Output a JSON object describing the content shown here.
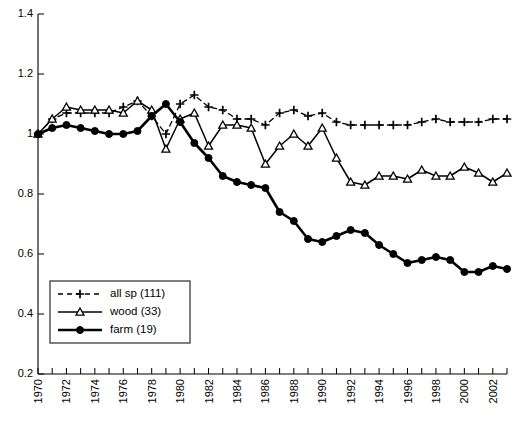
{
  "chart_data": {
    "type": "line",
    "title": "",
    "xlabel": "",
    "ylabel": "",
    "xlim": [
      1970,
      2003
    ],
    "ylim": [
      0.2,
      1.4
    ],
    "yticks": [
      "0.2",
      "0.4",
      "0.6",
      "0.8",
      "1",
      "1.2",
      "1.4"
    ],
    "ytick_values": [
      0.2,
      0.4,
      0.6,
      0.8,
      1.0,
      1.2,
      1.4
    ],
    "xticks": [
      "1970",
      "1972",
      "1974",
      "1976",
      "1978",
      "1980",
      "1982",
      "1984",
      "1986",
      "1988",
      "1990",
      "1992",
      "1994",
      "1996",
      "1998",
      "2000",
      "2002"
    ],
    "xtick_values": [
      1970,
      1972,
      1974,
      1976,
      1978,
      1980,
      1982,
      1984,
      1986,
      1988,
      1990,
      1992,
      1994,
      1996,
      1998,
      2000,
      2002
    ],
    "grid": false,
    "legend_position": "lower-left",
    "x": [
      1970,
      1971,
      1972,
      1973,
      1974,
      1975,
      1976,
      1977,
      1978,
      1979,
      1980,
      1981,
      1982,
      1983,
      1984,
      1985,
      1986,
      1987,
      1988,
      1989,
      1990,
      1991,
      1992,
      1993,
      1994,
      1995,
      1996,
      1997,
      1998,
      1999,
      2000,
      2001,
      2002,
      2003
    ],
    "series": [
      {
        "name": "all sp (111)",
        "label": "all sp (111)",
        "marker": "plus",
        "linestyle": "dashed",
        "linewidth": 1.3,
        "color": "#000000",
        "values": [
          1.0,
          1.05,
          1.07,
          1.07,
          1.07,
          1.07,
          1.09,
          1.11,
          1.06,
          1.0,
          1.1,
          1.13,
          1.09,
          1.08,
          1.05,
          1.05,
          1.03,
          1.07,
          1.08,
          1.06,
          1.07,
          1.04,
          1.03,
          1.03,
          1.03,
          1.03,
          1.03,
          1.04,
          1.05,
          1.04,
          1.04,
          1.04,
          1.05,
          1.05
        ]
      },
      {
        "name": "wood (33)",
        "label": "wood (33)",
        "marker": "triangle",
        "linestyle": "solid",
        "linewidth": 1.5,
        "color": "#000000",
        "values": [
          1.0,
          1.05,
          1.09,
          1.08,
          1.08,
          1.08,
          1.07,
          1.11,
          1.08,
          0.95,
          1.05,
          1.07,
          0.96,
          1.03,
          1.03,
          1.02,
          0.9,
          0.96,
          1.0,
          0.96,
          1.02,
          0.92,
          0.84,
          0.83,
          0.86,
          0.86,
          0.85,
          0.88,
          0.86,
          0.86,
          0.89,
          0.87,
          0.84,
          0.87
        ]
      },
      {
        "name": "farm (19)",
        "label": "farm (19)",
        "marker": "circle",
        "linestyle": "solid",
        "linewidth": 2.6,
        "color": "#000000",
        "values": [
          1.0,
          1.02,
          1.03,
          1.02,
          1.01,
          1.0,
          1.0,
          1.01,
          1.06,
          1.1,
          1.04,
          0.97,
          0.92,
          0.86,
          0.84,
          0.83,
          0.82,
          0.74,
          0.71,
          0.65,
          0.64,
          0.66,
          0.68,
          0.67,
          0.63,
          0.6,
          0.57,
          0.58,
          0.59,
          0.58,
          0.54,
          0.54,
          0.56,
          0.55
        ]
      }
    ]
  },
  "legend": {
    "items": [
      {
        "label": "all sp (111)"
      },
      {
        "label": "wood (33)"
      },
      {
        "label": "farm (19)"
      }
    ]
  }
}
